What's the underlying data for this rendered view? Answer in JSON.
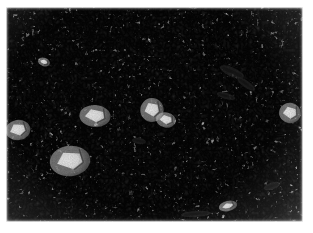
{
  "image": {
    "kind": "micrograph",
    "modality": "grayscale-optical-micrograph",
    "subject": "labyrinthine lamellar microstructure",
    "alt_text": "Grayscale micrograph showing a dense labyrinthine, worm-like two-phase microstructure with scattered bright wedge-shaped particles and a few dark elongated inclusions.",
    "canvas": {
      "width": 313,
      "height": 233
    },
    "background_color": "#ffffff",
    "plate": {
      "left": 6,
      "top": 7,
      "width": 297,
      "height": 215,
      "base_color": "#b9b9b9"
    },
    "has_scale_bar": false,
    "has_caption": false,
    "has_annotations": false,
    "has_text": false
  },
  "texture": {
    "description": "fine vermicular / labyrinthine two-phase pattern",
    "feature_scale_px": 2.6,
    "dark_tone": "#2c2c2c",
    "mid_tone": "#7d7d7d",
    "light_tone": "#efefef",
    "base_frequency_coarse": 0.055,
    "base_frequency_fine": 0.205,
    "octaves": 3,
    "contrast_slope": 11.5,
    "grain_opacity": 0.3
  },
  "features": {
    "bright_particles": [
      {
        "name": "wedge-particle-left-margin",
        "x": 18,
        "y": 130,
        "w": 16,
        "h": 12,
        "rotation": -8,
        "shape": "wedge"
      },
      {
        "name": "wedge-particle-lower-left",
        "x": 70,
        "y": 161,
        "w": 26,
        "h": 18,
        "rotation": -6,
        "shape": "wedge"
      },
      {
        "name": "wedge-particle-center-left",
        "x": 95,
        "y": 116,
        "w": 20,
        "h": 13,
        "rotation": 4,
        "shape": "wedge"
      },
      {
        "name": "wedge-particle-center",
        "x": 152,
        "y": 110,
        "w": 15,
        "h": 14,
        "rotation": -2,
        "shape": "wedge"
      },
      {
        "name": "wedge-particle-center-low",
        "x": 166,
        "y": 120,
        "w": 13,
        "h": 9,
        "rotation": 10,
        "shape": "wedge"
      },
      {
        "name": "wedge-particle-right-edge",
        "x": 290,
        "y": 113,
        "w": 14,
        "h": 12,
        "rotation": 6,
        "shape": "wedge"
      },
      {
        "name": "bright-fleck-lower-center",
        "x": 228,
        "y": 206,
        "w": 12,
        "h": 6,
        "rotation": -14,
        "shape": "sliver"
      },
      {
        "name": "bright-fleck-upper-left",
        "x": 44,
        "y": 62,
        "w": 8,
        "h": 5,
        "rotation": 20,
        "shape": "sliver"
      }
    ],
    "dark_inclusions": [
      {
        "name": "dark-inclusion-upper-right-a",
        "x": 232,
        "y": 72,
        "w": 26,
        "h": 9,
        "rotation": 24
      },
      {
        "name": "dark-inclusion-upper-right-b",
        "x": 246,
        "y": 84,
        "w": 21,
        "h": 7,
        "rotation": 36
      },
      {
        "name": "dark-inclusion-right-mid",
        "x": 226,
        "y": 96,
        "w": 19,
        "h": 6,
        "rotation": 16
      },
      {
        "name": "dark-inclusion-lower-right",
        "x": 272,
        "y": 186,
        "w": 17,
        "h": 7,
        "rotation": -18
      },
      {
        "name": "dark-inclusion-center",
        "x": 139,
        "y": 141,
        "w": 14,
        "h": 6,
        "rotation": 8
      },
      {
        "name": "dark-inclusion-lower-band",
        "x": 196,
        "y": 214,
        "w": 30,
        "h": 6,
        "rotation": -4
      }
    ]
  }
}
